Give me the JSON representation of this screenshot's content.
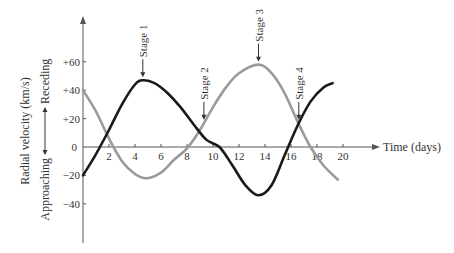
{
  "chart_data": {
    "type": "line",
    "title": "",
    "xlabel": "Time (days)",
    "ylabel": "Radial velocity (km/s)",
    "y_direction_labels": {
      "positive": "Receding",
      "negative": "Approaching"
    },
    "xlim": [
      0,
      20
    ],
    "ylim": [
      -60,
      80
    ],
    "x_ticks": [
      2,
      4,
      6,
      8,
      10,
      12,
      14,
      16,
      18,
      20
    ],
    "x_tick_labels": [
      "2",
      "4",
      "6",
      "8",
      "10",
      "12",
      "14",
      "16",
      "18",
      "20"
    ],
    "y_ticks": [
      60,
      40,
      20,
      0,
      -20,
      -40
    ],
    "y_tick_labels": [
      "+60",
      "+40",
      "+20",
      "0",
      "−20",
      "−40"
    ],
    "grid": false,
    "legend": null,
    "series": [
      {
        "name": "Star A (black)",
        "color": "#1a1a1a",
        "x": [
          0,
          1,
          2,
          3,
          4,
          4.6,
          5.5,
          6.5,
          7.5,
          8.5,
          9.5,
          10.5,
          11.5,
          12.5,
          13.5,
          14.5,
          15.5,
          16.5,
          17.5,
          18.5,
          19.2
        ],
        "y": [
          -20,
          -5,
          12,
          30,
          44,
          47,
          45,
          38,
          28,
          16,
          5,
          0,
          -13,
          -27,
          -34,
          -27,
          -6,
          15,
          32,
          42,
          45
        ]
      },
      {
        "name": "Star B (gray)",
        "color": "#9a9a9a",
        "x": [
          0,
          1,
          2,
          3,
          4,
          4.9,
          6,
          7,
          8,
          9,
          10,
          11,
          12,
          13.5,
          14.5,
          15.5,
          16.5,
          17.5,
          18.5,
          19.6
        ],
        "y": [
          40,
          25,
          6,
          -10,
          -19,
          -22,
          -18,
          -9,
          -1,
          12,
          28,
          42,
          52,
          58,
          52,
          38,
          18,
          0,
          -13,
          -23
        ]
      }
    ],
    "annotations": [
      {
        "label": "Stage 1",
        "x": 4.6,
        "y": 47
      },
      {
        "label": "Stage 2",
        "x": 9.3,
        "y": 17
      },
      {
        "label": "Stage 3",
        "x": 13.5,
        "y": 58
      },
      {
        "label": "Stage 4",
        "x": 16.6,
        "y": 17
      }
    ]
  }
}
